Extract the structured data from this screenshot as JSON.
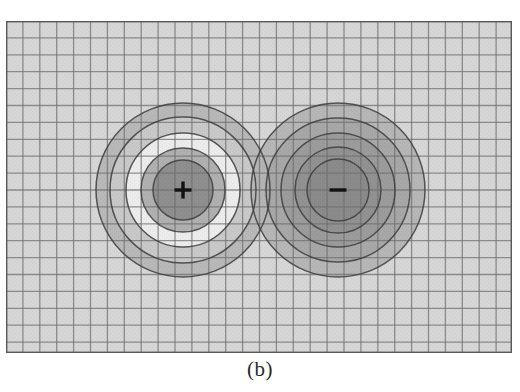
{
  "figure": {
    "caption": "(b)",
    "kind": "grayscale-contour-map"
  },
  "canvas": {
    "x": 6,
    "y": 21,
    "width": 506,
    "height": 332,
    "background_color": "#d6d6d6",
    "border_color": "#585858",
    "border_width": 1.4
  },
  "grid": {
    "visible": true,
    "cell_size": 16.9,
    "columns": 30,
    "rows": 20,
    "line_color": "#6e6e6e",
    "line_width": 1.3,
    "minor_line_color": "#9a9a9a"
  },
  "contour_line": {
    "color": "#3d3d3d",
    "width": 1.5
  },
  "charges": [
    {
      "id": "positive-charge",
      "label": "+",
      "sign": "positive",
      "cx": 177,
      "cy": 169,
      "marker_color": "#111111",
      "marker_size": 17,
      "rings": [
        {
          "r": 87,
          "fill": "#b6b6b6",
          "label": "outer-band"
        },
        {
          "r": 73,
          "fill": "#c9c9c9",
          "label": "band-4"
        },
        {
          "r": 57,
          "fill": "#efefef",
          "label": "bright-band"
        },
        {
          "r": 42,
          "fill": "#ababab",
          "label": "band-2"
        },
        {
          "r": 30,
          "fill": "#8b8b8b",
          "label": "core"
        }
      ]
    },
    {
      "id": "negative-charge",
      "label": "−",
      "sign": "negative",
      "cx": 332,
      "cy": 169,
      "marker_color": "#111111",
      "marker_size": 17,
      "rings": [
        {
          "r": 87,
          "fill": "#b4b4b4",
          "label": "outer-band"
        },
        {
          "r": 72,
          "fill": "#a6a6a6",
          "label": "band-4"
        },
        {
          "r": 57,
          "fill": "#9a9a9a",
          "label": "band-3"
        },
        {
          "r": 43,
          "fill": "#909090",
          "label": "band-2"
        },
        {
          "r": 31,
          "fill": "#8a8a8a",
          "label": "core"
        }
      ]
    }
  ],
  "chart_data": {
    "type": "heatmap",
    "title": "",
    "subtitle": "",
    "xlabel": "",
    "ylabel": "",
    "annotations": [
      "+",
      "−"
    ],
    "legend": [],
    "grid": true,
    "colormap": "grayscale",
    "xlim": [
      0,
      30
    ],
    "ylim": [
      0,
      20
    ],
    "sources": [
      {
        "name": "positive charge",
        "x": 10.1,
        "y": 9.6,
        "sign": "+",
        "equipotential_radii_cells": [
          1.8,
          2.5,
          3.4,
          4.3,
          5.1
        ]
      },
      {
        "name": "negative charge",
        "x": 19.3,
        "y": 9.6,
        "sign": "-",
        "equipotential_radii_cells": [
          1.8,
          2.5,
          3.4,
          4.3,
          5.1
        ]
      }
    ],
    "levels": [
      {
        "index": 1,
        "gray_positive": "#8b8b8b",
        "gray_negative": "#8a8a8a"
      },
      {
        "index": 2,
        "gray_positive": "#ababab",
        "gray_negative": "#909090"
      },
      {
        "index": 3,
        "gray_positive": "#efefef",
        "gray_negative": "#9a9a9a"
      },
      {
        "index": 4,
        "gray_positive": "#c9c9c9",
        "gray_negative": "#a6a6a6"
      },
      {
        "index": 5,
        "gray_positive": "#b6b6b6",
        "gray_negative": "#b4b4b4"
      }
    ],
    "background_level_gray": "#d6d6d6"
  }
}
